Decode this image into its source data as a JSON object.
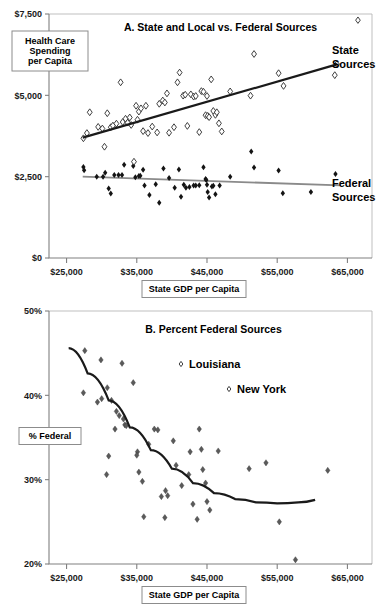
{
  "figure": {
    "width": 388,
    "height": 616,
    "background": "#ffffff"
  },
  "chart_data": [
    {
      "id": "panel-a",
      "type": "scatter",
      "title": "A. State and Local vs. Federal Sources",
      "xlabel": "State GDP per Capita",
      "ylabel": "Health Care Spending per Capita",
      "xlim": [
        22500,
        68500
      ],
      "ylim": [
        0,
        7500
      ],
      "xticks": [
        25000,
        35000,
        45000,
        55000,
        65000
      ],
      "xtick_labels": [
        "$25,000",
        "$35,000",
        "$45,000",
        "$55,000",
        "$65,000"
      ],
      "yticks": [
        0,
        2500,
        5000,
        7500
      ],
      "ytick_labels": [
        "$0",
        "$2,500",
        "$5,000",
        "$7,500"
      ],
      "grid": false,
      "legend_position": "right-inline",
      "series": [
        {
          "name": "State Sources",
          "marker": "open-diamond",
          "color": "#ffffff",
          "edge_color": "#2b2b2b",
          "label_line1": "State",
          "label_line2": "Sources",
          "trendline": {
            "style": "solid-dark",
            "x": [
              27300,
              63500
            ],
            "y": [
              3700,
              5950
            ]
          },
          "points": [
            [
              27400,
              3680
            ],
            [
              27900,
              3840
            ],
            [
              28300,
              4480
            ],
            [
              29500,
              4030
            ],
            [
              30100,
              3980
            ],
            [
              30400,
              3420
            ],
            [
              30800,
              4450
            ],
            [
              31300,
              4020
            ],
            [
              31600,
              4070
            ],
            [
              32100,
              4130
            ],
            [
              32700,
              5400
            ],
            [
              33000,
              4180
            ],
            [
              33400,
              4280
            ],
            [
              33700,
              4160
            ],
            [
              34000,
              4320
            ],
            [
              34200,
              4090
            ],
            [
              34600,
              2960
            ],
            [
              34900,
              4680
            ],
            [
              35100,
              4250
            ],
            [
              35300,
              4500
            ],
            [
              35600,
              4600
            ],
            [
              35900,
              3900
            ],
            [
              36300,
              4680
            ],
            [
              36600,
              3840
            ],
            [
              37200,
              4040
            ],
            [
              37900,
              3860
            ],
            [
              38200,
              4740
            ],
            [
              38700,
              4840
            ],
            [
              39000,
              4780
            ],
            [
              39300,
              5060
            ],
            [
              39600,
              3850
            ],
            [
              40300,
              4020
            ],
            [
              40800,
              5400
            ],
            [
              41100,
              5700
            ],
            [
              41600,
              4990
            ],
            [
              41900,
              5020
            ],
            [
              42200,
              4060
            ],
            [
              42700,
              5030
            ],
            [
              43100,
              4960
            ],
            [
              43400,
              4980
            ],
            [
              43900,
              3870
            ],
            [
              44200,
              5130
            ],
            [
              44500,
              5110
            ],
            [
              44800,
              4390
            ],
            [
              45000,
              4980
            ],
            [
              45100,
              4370
            ],
            [
              45300,
              4330
            ],
            [
              45600,
              5490
            ],
            [
              45900,
              4520
            ],
            [
              46200,
              4400
            ],
            [
              46400,
              4480
            ],
            [
              46700,
              4140
            ],
            [
              47100,
              3890
            ],
            [
              48300,
              5120
            ],
            [
              51200,
              4990
            ],
            [
              51700,
              6270
            ],
            [
              55200,
              5680
            ],
            [
              55900,
              5290
            ],
            [
              63200,
              5620
            ],
            [
              63500,
              5960
            ]
          ]
        },
        {
          "name": "Federal Sources",
          "marker": "solid-diamond",
          "color": "#141414",
          "label_line1": "Federal",
          "label_line2": "Sources",
          "trendline": {
            "style": "solid-gray",
            "x": [
              27300,
              64000
            ],
            "y": [
              2500,
              2230
            ]
          },
          "points": [
            [
              27400,
              2800
            ],
            [
              27500,
              2700
            ],
            [
              29300,
              2500
            ],
            [
              30200,
              2500
            ],
            [
              30500,
              2620
            ],
            [
              31000,
              2140
            ],
            [
              31300,
              1980
            ],
            [
              31800,
              2550
            ],
            [
              32400,
              2550
            ],
            [
              32900,
              2550
            ],
            [
              33200,
              2870
            ],
            [
              34500,
              2830
            ],
            [
              34800,
              2480
            ],
            [
              35300,
              2520
            ],
            [
              35500,
              2530
            ],
            [
              35900,
              2710
            ],
            [
              36100,
              2230
            ],
            [
              36800,
              1940
            ],
            [
              37700,
              2270
            ],
            [
              38200,
              1700
            ],
            [
              38800,
              2750
            ],
            [
              39600,
              2460
            ],
            [
              40400,
              2160
            ],
            [
              41000,
              2720
            ],
            [
              41300,
              1880
            ],
            [
              41700,
              2250
            ],
            [
              42000,
              2160
            ],
            [
              42500,
              2180
            ],
            [
              43100,
              2230
            ],
            [
              43400,
              2230
            ],
            [
              43900,
              2240
            ],
            [
              44500,
              2790
            ],
            [
              44800,
              2430
            ],
            [
              44900,
              2400
            ],
            [
              45000,
              2250
            ],
            [
              45100,
              2030
            ],
            [
              45300,
              1860
            ],
            [
              45700,
              2200
            ],
            [
              45900,
              2220
            ],
            [
              46200,
              1960
            ],
            [
              46800,
              2230
            ],
            [
              48300,
              2500
            ],
            [
              51300,
              3270
            ],
            [
              51700,
              2780
            ],
            [
              55200,
              2690
            ],
            [
              55800,
              1990
            ],
            [
              59800,
              2030
            ],
            [
              63300,
              2580
            ]
          ]
        }
      ]
    },
    {
      "id": "panel-b",
      "type": "scatter",
      "title": "B. Percent Federal Sources",
      "xlabel": "State GDP per Capita",
      "ylabel": "% Federal",
      "xlim": [
        22500,
        68500
      ],
      "ylim": [
        20,
        50
      ],
      "xticks": [
        25000,
        35000,
        45000,
        55000,
        65000
      ],
      "xtick_labels": [
        "$25,000",
        "$35,000",
        "$45,000",
        "$55,000",
        "$65,000"
      ],
      "yticks": [
        20,
        30,
        40,
        50
      ],
      "ytick_labels": [
        "20%",
        "30%",
        "40%",
        "50%"
      ],
      "grid": false,
      "legend_position": "inside-upper-right",
      "annotations": [
        {
          "label": "Louisiana",
          "marker": "open-diamond"
        },
        {
          "label": "New York",
          "marker": "open-diamond"
        }
      ],
      "series": [
        {
          "name": "% Federal",
          "marker": "solid-diamond",
          "color": "#4a4a4a",
          "trendline": {
            "style": "curve-dark",
            "points": [
              [
                25300,
                45.6
              ],
              [
                28000,
                42.6
              ],
              [
                31000,
                39.4
              ],
              [
                34000,
                36.2
              ],
              [
                37000,
                33.5
              ],
              [
                40000,
                31.3
              ],
              [
                43000,
                29.6
              ],
              [
                46000,
                28.4
              ],
              [
                49000,
                27.7
              ],
              [
                52000,
                27.3
              ],
              [
                55000,
                27.2
              ],
              [
                58000,
                27.3
              ],
              [
                60400,
                27.6
              ]
            ]
          },
          "points": [
            [
              27600,
              45.3
            ],
            [
              27400,
              40.3
            ],
            [
              29400,
              39.2
            ],
            [
              29900,
              44.2
            ],
            [
              30000,
              39.6
            ],
            [
              30800,
              40.9
            ],
            [
              31000,
              32.8
            ],
            [
              30700,
              30.6
            ],
            [
              31400,
              39.4
            ],
            [
              31900,
              36.0
            ],
            [
              32100,
              38.1
            ],
            [
              32500,
              37.6
            ],
            [
              32900,
              43.8
            ],
            [
              33100,
              37.2
            ],
            [
              33300,
              36.5
            ],
            [
              33500,
              36.4
            ],
            [
              34500,
              41.5
            ],
            [
              35100,
              33.3
            ],
            [
              35000,
              32.9
            ],
            [
              35300,
              30.9
            ],
            [
              35800,
              29.8
            ],
            [
              36000,
              25.6
            ],
            [
              36700,
              34.2
            ],
            [
              37500,
              36.0
            ],
            [
              38000,
              35.9
            ],
            [
              38500,
              28.0
            ],
            [
              39100,
              28.7
            ],
            [
              39400,
              28.1
            ],
            [
              39000,
              25.5
            ],
            [
              40200,
              34.6
            ],
            [
              40600,
              31.7
            ],
            [
              41400,
              29.3
            ],
            [
              42400,
              30.6
            ],
            [
              42600,
              33.3
            ],
            [
              43000,
              27.1
            ],
            [
              43600,
              25.3
            ],
            [
              43900,
              36.0
            ],
            [
              44200,
              33.6
            ],
            [
              44400,
              31.2
            ],
            [
              44800,
              29.6
            ],
            [
              45000,
              27.4
            ],
            [
              45400,
              26.4
            ],
            [
              46600,
              33.4
            ],
            [
              51000,
              31.3
            ],
            [
              53400,
              32.0
            ],
            [
              55300,
              25.0
            ],
            [
              57600,
              20.5
            ],
            [
              62200,
              31.1
            ]
          ]
        }
      ]
    }
  ],
  "panel_a": {
    "title": "A. State and Local vs. Federal Sources",
    "y_axis_box": "Health Care Spending per Capita",
    "y_axis_box_lines": [
      "Health Care",
      "Spending",
      "per Capita"
    ],
    "x_axis_box": "State GDP per Capita",
    "state_label_line1": "State",
    "state_label_line2": "Sources",
    "federal_label_line1": "Federal",
    "federal_label_line2": "Sources",
    "ytick_labels": [
      "$7,500",
      "$5,000",
      "$2,500",
      "$0"
    ],
    "xtick_labels": [
      "$25,000",
      "$35,000",
      "$45,000",
      "$55,000",
      "$65,000"
    ]
  },
  "panel_b": {
    "title": "B. Percent Federal Sources",
    "y_axis_box": "% Federal",
    "x_axis_box": "State GDP per Capita",
    "legend_louisiana": "Louisiana",
    "legend_newyork": "New York",
    "ytick_labels": [
      "50%",
      "40%",
      "30%",
      "20%"
    ],
    "xtick_labels": [
      "$25,000",
      "$35,000",
      "$45,000",
      "$55,000",
      "$65,000"
    ]
  },
  "colors": {
    "state_trend": "#1a1a1a",
    "federal_trend": "#8a8a8a",
    "axis": "#808080",
    "frame": "#b8b8b8",
    "solid_marker": "#141414",
    "gray_marker": "#4a4a4a",
    "open_marker_edge": "#2b2b2b"
  }
}
